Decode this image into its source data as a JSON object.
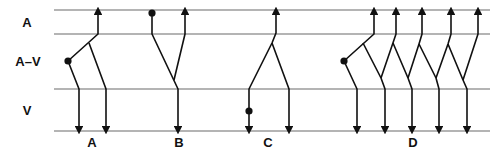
{
  "rows": {
    "atrium": "A",
    "av_junction": "A–V",
    "ventricle": "V"
  },
  "panels": [
    {
      "id": "A",
      "label": "A"
    },
    {
      "id": "B",
      "label": "B"
    },
    {
      "id": "C",
      "label": "C"
    },
    {
      "id": "D",
      "label": "D"
    }
  ],
  "colors": {
    "rail": "#6a6a6a",
    "ink": "#111111",
    "background": "#ffffff"
  }
}
